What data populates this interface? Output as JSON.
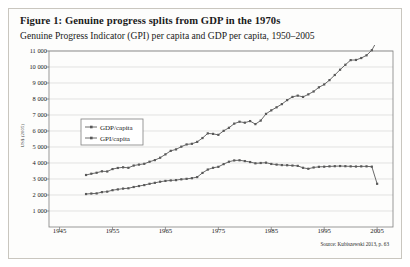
{
  "figure": {
    "title": "Figure 1: Genuine progress splits from GDP in the 1970s",
    "subtitle": "Genuine Progress Indicator (GPI) per capita and GDP per capita, 1950–2005",
    "source": "Source: Kubiszewski 2013, p. 63"
  },
  "colors": {
    "series_gdp": "#595959",
    "series_gpi": "#595959",
    "grid": "#d6d6d6",
    "axis": "#7f7f7f",
    "card_border": "#c9c6bf",
    "background": "#fdfdfc"
  },
  "chart_data": {
    "type": "line",
    "title": "Genuine Progress Indicator (GPI) per capita and GDP per capita, 1950–2005",
    "xlabel": "",
    "ylabel": "US$ (2005)",
    "xlim": [
      1943,
      2008
    ],
    "ylim": [
      0,
      11000
    ],
    "ytick_step": 1000,
    "yticks": [
      1000,
      2000,
      3000,
      4000,
      5000,
      6000,
      7000,
      8000,
      9000,
      10000,
      11000
    ],
    "xticks": [
      1945,
      1955,
      1965,
      1975,
      1985,
      1995,
      2005
    ],
    "grid": true,
    "legend_position": "upper-left",
    "marker": "square",
    "x": [
      1950,
      1951,
      1952,
      1953,
      1954,
      1955,
      1956,
      1957,
      1958,
      1959,
      1960,
      1961,
      1962,
      1963,
      1964,
      1965,
      1966,
      1967,
      1968,
      1969,
      1970,
      1971,
      1972,
      1973,
      1974,
      1975,
      1976,
      1977,
      1978,
      1979,
      1980,
      1981,
      1982,
      1983,
      1984,
      1985,
      1986,
      1987,
      1988,
      1989,
      1990,
      1991,
      1992,
      1993,
      1994,
      1995,
      1996,
      1997,
      1998,
      1999,
      2000,
      2001,
      2002,
      2003,
      2004,
      2005
    ],
    "series": [
      {
        "name": "GDP/capita",
        "values": [
          3250,
          3330,
          3390,
          3480,
          3470,
          3620,
          3690,
          3730,
          3700,
          3840,
          3900,
          3950,
          4080,
          4180,
          4330,
          4540,
          4760,
          4850,
          5020,
          5160,
          5200,
          5320,
          5560,
          5850,
          5820,
          5760,
          6010,
          6200,
          6460,
          6580,
          6520,
          6620,
          6430,
          6650,
          7070,
          7290,
          7480,
          7680,
          7930,
          8130,
          8210,
          8130,
          8290,
          8470,
          8730,
          8910,
          9180,
          9500,
          9830,
          10140,
          10430,
          10440,
          10560,
          10730,
          11050,
          11650
        ]
      },
      {
        "name": "GPI/capita",
        "values": [
          2060,
          2090,
          2100,
          2180,
          2210,
          2300,
          2350,
          2400,
          2420,
          2500,
          2560,
          2620,
          2700,
          2760,
          2830,
          2880,
          2910,
          2930,
          2980,
          3010,
          3050,
          3120,
          3380,
          3590,
          3700,
          3760,
          3930,
          4080,
          4160,
          4170,
          4120,
          4060,
          3980,
          4000,
          4020,
          3940,
          3900,
          3870,
          3860,
          3840,
          3820,
          3700,
          3640,
          3720,
          3760,
          3770,
          3790,
          3800,
          3810,
          3800,
          3790,
          3780,
          3790,
          3790,
          3770,
          2700
        ]
      }
    ]
  },
  "legend": {
    "items": [
      {
        "label": "GDP/capita"
      },
      {
        "label": "GPI/capita"
      }
    ]
  }
}
